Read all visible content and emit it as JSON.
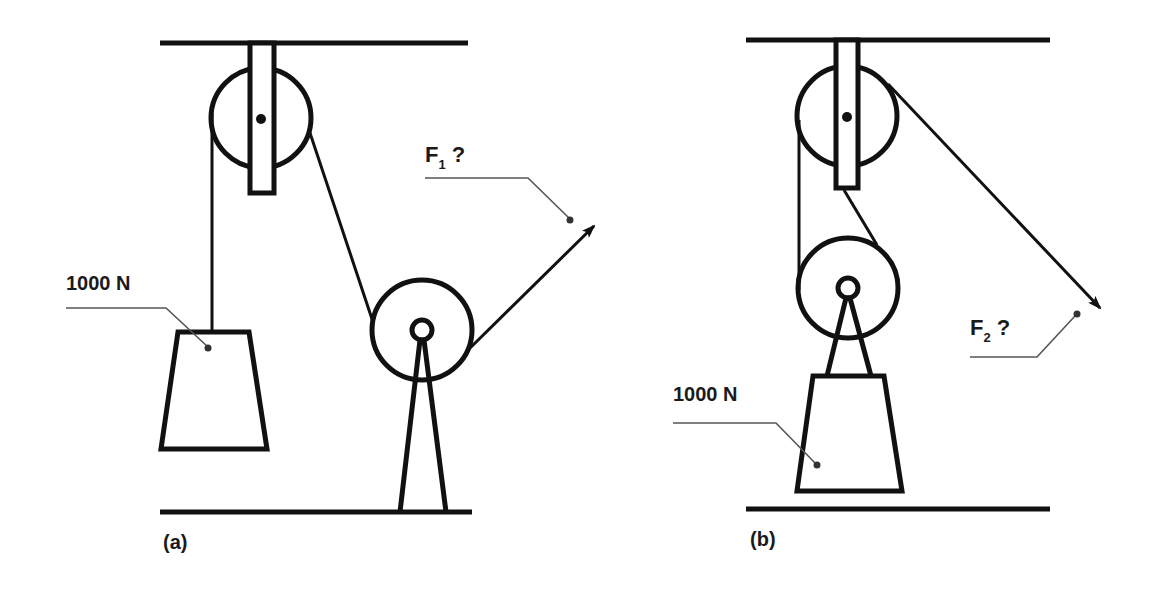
{
  "diagram": {
    "type": "pulley-systems",
    "panels": [
      {
        "id": "a",
        "caption": "(a)",
        "load_label": "1000 N",
        "force_label": "F",
        "force_subscript": "1",
        "force_question": "?",
        "description": "Fixed pulley on ceiling; rope from hanging load passes over it to a second pulley on a floor stand, then pulled up-right with force F1"
      },
      {
        "id": "b",
        "caption": "(b)",
        "load_label": "1000 N",
        "force_label": "F",
        "force_subscript": "2",
        "force_question": "?",
        "description": "Fixed pulley on ceiling with movable pulley carrying the load; rope pulled down-right with force F2"
      }
    ],
    "colors": {
      "line": "#111111",
      "leader": "#555555",
      "background": "#ffffff"
    }
  }
}
